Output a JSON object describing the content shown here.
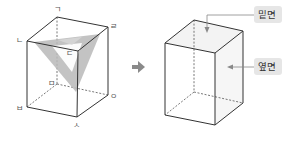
{
  "figure": {
    "left_prism": {
      "vertex_labels": {
        "g": "ㄱ",
        "n": "ㄴ",
        "d": "ㄷ",
        "r": "ㄹ",
        "m": "ㅁ",
        "b": "ㅂ",
        "s": "ㅅ",
        "o": "ㅇ"
      },
      "cross_section_color": "#b5b5b5"
    },
    "transform_arrow": "arrow-right",
    "right_prism": {
      "base_label": "밑면",
      "lateral_label": "옆면",
      "face_shade": "#f3f3f3",
      "tag_bg": "#e6e6e6"
    },
    "colors": {
      "edge": "#333333",
      "hidden_edge": "#555555",
      "arrow": "#8a8a8a"
    }
  }
}
